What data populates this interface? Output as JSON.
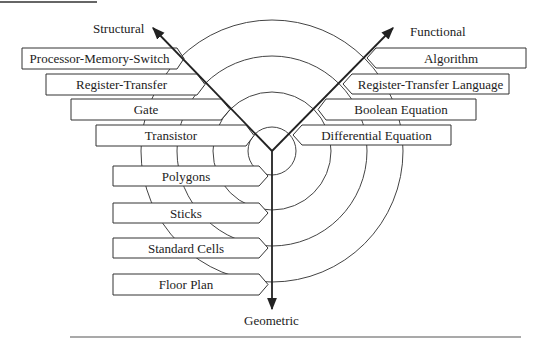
{
  "diagram": {
    "type": "Gajski-Kuhn Y-chart",
    "axes": {
      "structural": "Structural",
      "functional": "Functional",
      "geometric": "Geometric"
    },
    "structural_levels": [
      "Processor-Memory-Switch",
      "Register-Transfer",
      "Gate",
      "Transistor"
    ],
    "functional_levels": [
      "Algorithm",
      "Register-Transfer Language",
      "Boolean Equation",
      "Differential Equation"
    ],
    "geometric_levels": [
      "Polygons",
      "Sticks",
      "Standard Cells",
      "Floor Plan"
    ],
    "colors": {
      "line": "#222222",
      "circle": "#444444",
      "box_fill": "#ffffff"
    }
  }
}
